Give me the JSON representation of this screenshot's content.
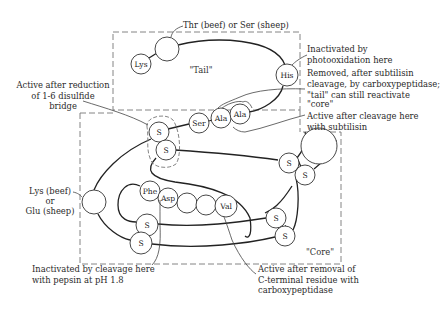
{
  "diagram": {
    "regions": {
      "tail": "\"Tail\"",
      "core": "\"Core\""
    },
    "residues": {
      "lys_tail": "Lys",
      "thr_ser": "",
      "his": "His",
      "ser": "Ser",
      "ala1": "Ala",
      "ala2": "Ala",
      "s_bridge_top": "S",
      "s_bridge_bottom": "S",
      "s_right_top": "S",
      "s_right_bottom": "S",
      "lys_glu": "",
      "phe": "Phe",
      "asp": "Asp",
      "blank1": "",
      "blank2": "",
      "val": "Val",
      "s_left_top": "S",
      "s_left_bottom": "S",
      "s_lowright_top": "S",
      "s_lowright_bottom": "S"
    },
    "annotations": {
      "thr_ser": "Thr (beef) or Ser (sheep)",
      "photoox": [
        "Inactivated by",
        "photooxidation here"
      ],
      "removed": [
        "Removed, after subtilisin",
        "cleavage, by carboxypeptidase;",
        "\"tail\" can still reactivate",
        "\"core\""
      ],
      "subtilisin": [
        "Active after cleavage here",
        "with subtilisin"
      ],
      "disulfide": [
        "Active after reduction",
        "of 1-6 disulfide",
        "bridge"
      ],
      "lys_glu": [
        "Lys (beef)",
        "or",
        "Glu (sheep)"
      ],
      "pepsin": [
        "Inactivated by cleavage here",
        "with pepsin at pH 1.8"
      ],
      "cterm": [
        "Active after removal of",
        "C-terminal residue with",
        "carboxypeptidase"
      ]
    }
  }
}
